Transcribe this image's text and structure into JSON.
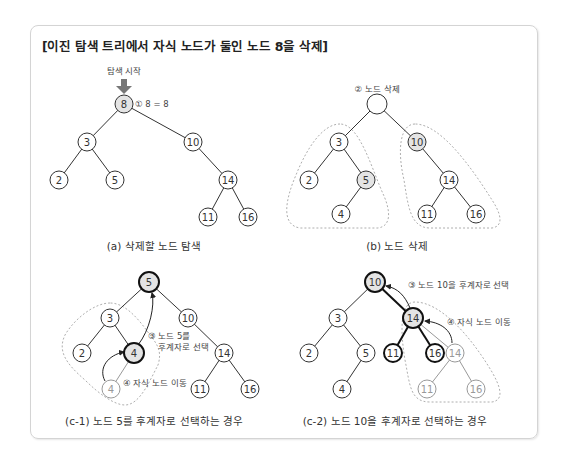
{
  "title": "[이진 탐색 트리에서 자식 노드가 둘인 노드 8을 삭제]",
  "panel_a": {
    "caption": "(a) 삭제할 노드 탐색",
    "start_label": "탐색 시작",
    "step1": "① 8 = 8",
    "nodes": {
      "n8": "8",
      "n3": "3",
      "n10": "10",
      "n2": "2",
      "n5": "5",
      "n14": "14",
      "n11": "11",
      "n16": "16"
    }
  },
  "panel_b": {
    "caption": "(b) 노드 삭제",
    "step2": "② 노드 삭제",
    "nodes": {
      "n3": "3",
      "n10": "10",
      "n2": "2",
      "n5": "5",
      "n4": "4",
      "n14": "14",
      "n11": "11",
      "n16": "16"
    }
  },
  "panel_c1": {
    "caption": "(c-1) 노드 5를 후계자로 선택하는 경우",
    "step3_line1": "③ 노드 5를",
    "step3_line2": "후계자로 선택",
    "step4": "④ 자식 노드 이동",
    "nodes": {
      "n5": "5",
      "n3": "3",
      "n10": "10",
      "n2": "2",
      "n4": "4",
      "n4_old": "4",
      "n14": "14",
      "n11": "11",
      "n16": "16"
    }
  },
  "panel_c2": {
    "caption": "(c-2) 노드 10을 후계자로 선택하는 경우",
    "step3": "③ 노드 10을 후계자로 선택",
    "step4": "④ 자식 노드 이동",
    "nodes": {
      "n10": "10",
      "n3": "3",
      "n14": "14",
      "n2": "2",
      "n5": "5",
      "n11": "11",
      "n16": "16",
      "n14_old": "14",
      "n4": "4",
      "n11_old": "11",
      "n16_old": "16"
    }
  },
  "colors": {
    "highlight_fill": "#e4e4e4",
    "line": "#333333",
    "faded": "#999999",
    "dashed": "#999999"
  }
}
